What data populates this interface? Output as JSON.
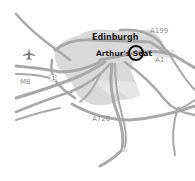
{
  "map": {
    "city_label": "Edinburgh",
    "poi_label": "Arthur's Seat",
    "road_labels": {
      "a199": "A199",
      "a1": "A1",
      "m8": "M8",
      "a720": "A720",
      "junction": "1"
    },
    "icons": {
      "airport": "airplane-icon",
      "marker": "circle-marker"
    },
    "colors": {
      "background": "#ffffff",
      "urban_area": "#d9d9d9",
      "road": "#a8a8a8",
      "marker": "#111111",
      "label_dark": "#1a1a1a",
      "label_road": "#8a8a8a"
    }
  }
}
